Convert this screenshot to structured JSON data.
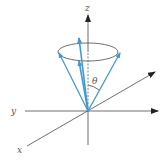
{
  "diagram": {
    "labels": {
      "z": "z",
      "y": "y",
      "x": "x",
      "theta": "θ"
    },
    "colors": {
      "axis": "#4a4a4a",
      "vector": "#3d9ad8",
      "label": "#555555",
      "background": "#ffffff"
    },
    "elements": [
      {
        "id": "z-axis",
        "type": "axis",
        "from": [
          88,
          145
        ],
        "to": [
          88,
          15
        ],
        "arrow": true
      },
      {
        "id": "y-axis",
        "type": "axis",
        "from": [
          25,
          111
        ],
        "to": [
          158,
          111
        ],
        "arrow": true
      },
      {
        "id": "x-axis",
        "type": "axis",
        "from": [
          27,
          146
        ],
        "to": [
          155,
          72
        ],
        "arrow": true
      },
      {
        "id": "cone-rim",
        "type": "ellipse",
        "center": [
          88,
          52
        ],
        "rx": 30,
        "ry": 9
      },
      {
        "id": "cone-edge-left",
        "type": "vector",
        "from": [
          88,
          111
        ],
        "to": [
          59,
          53
        ]
      },
      {
        "id": "cone-edge-right",
        "type": "vector",
        "from": [
          88,
          111
        ],
        "to": [
          120,
          53
        ]
      },
      {
        "id": "vector-long",
        "type": "vector",
        "from": [
          88,
          111
        ],
        "to": [
          79,
          38
        ]
      },
      {
        "id": "vector-short",
        "type": "vector",
        "from": [
          88,
          111
        ],
        "to": [
          79,
          61
        ]
      },
      {
        "id": "theta-arc",
        "type": "arc",
        "between": [
          "z-axis",
          "cone-edge-right"
        ]
      }
    ]
  }
}
